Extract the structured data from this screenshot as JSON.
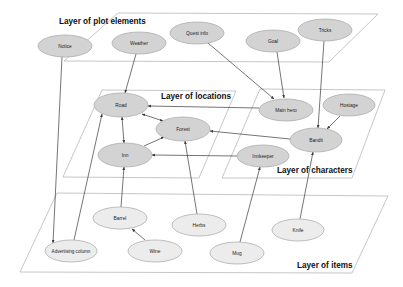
{
  "colors": {
    "node_dark": "#d3d3d3",
    "node_light": "#ececec",
    "node_stroke": "#a6a6a6",
    "plane_stroke": "#b8b8b8",
    "edge": "#3a3a3a"
  },
  "layers": [
    {
      "id": "plot",
      "label": "Layer of plot elements",
      "points": "64,61 118,13 378,14 329,62",
      "label_x": 59,
      "label_y": 24
    },
    {
      "id": "locations",
      "label": "Layer of locations",
      "points": "63,177 102,90 236,91 199,178",
      "label_x": 161,
      "label_y": 99
    },
    {
      "id": "characters",
      "label": "Layer of characters",
      "points": "222,178 260,89 385,90 352,178",
      "label_x": 277,
      "label_y": 173
    },
    {
      "id": "items",
      "label": "Layer of items",
      "points": "20,272 57,193 388,196 352,273",
      "label_x": 297,
      "label_y": 268
    }
  ],
  "nodes": [
    {
      "id": "notice",
      "label": "Notice",
      "x": 65,
      "y": 46,
      "rx": 27,
      "ry": 11,
      "tone": "dark"
    },
    {
      "id": "weather",
      "label": "Weather",
      "x": 139,
      "y": 43,
      "rx": 27,
      "ry": 11,
      "tone": "dark"
    },
    {
      "id": "quest",
      "label": "Quest info",
      "x": 197,
      "y": 33,
      "rx": 27,
      "ry": 11,
      "tone": "dark"
    },
    {
      "id": "goal",
      "label": "Goal",
      "x": 273,
      "y": 41,
      "rx": 27,
      "ry": 11,
      "tone": "dark"
    },
    {
      "id": "tricks",
      "label": "Tricks",
      "x": 325,
      "y": 30,
      "rx": 27,
      "ry": 11,
      "tone": "dark"
    },
    {
      "id": "road",
      "label": "Road",
      "x": 121,
      "y": 105,
      "rx": 27,
      "ry": 12,
      "tone": "dark"
    },
    {
      "id": "forest",
      "label": "Forest",
      "x": 183,
      "y": 129,
      "rx": 27,
      "ry": 12,
      "tone": "dark"
    },
    {
      "id": "inn",
      "label": "Inn",
      "x": 125,
      "y": 155,
      "rx": 27,
      "ry": 12,
      "tone": "dark"
    },
    {
      "id": "mainhero",
      "label": "Main hero",
      "x": 286,
      "y": 110,
      "rx": 27,
      "ry": 11,
      "tone": "dark"
    },
    {
      "id": "hostage",
      "label": "Hostage",
      "x": 349,
      "y": 105,
      "rx": 26,
      "ry": 11,
      "tone": "dark"
    },
    {
      "id": "bandit",
      "label": "Bandit",
      "x": 316,
      "y": 140,
      "rx": 26,
      "ry": 12,
      "tone": "dark"
    },
    {
      "id": "innkeeper",
      "label": "Innkeeper",
      "x": 263,
      "y": 156,
      "rx": 26,
      "ry": 11,
      "tone": "dark"
    },
    {
      "id": "barrel",
      "label": "Barrel",
      "x": 120,
      "y": 218,
      "rx": 27,
      "ry": 11,
      "tone": "light"
    },
    {
      "id": "herbs",
      "label": "Herbs",
      "x": 199,
      "y": 225,
      "rx": 27,
      "ry": 11,
      "tone": "light"
    },
    {
      "id": "knife",
      "label": "Knife",
      "x": 298,
      "y": 230,
      "rx": 26,
      "ry": 11,
      "tone": "light"
    },
    {
      "id": "advcol",
      "label": "Advertising column",
      "x": 71,
      "y": 251,
      "rx": 26,
      "ry": 11,
      "tone": "light"
    },
    {
      "id": "wine",
      "label": "Wine",
      "x": 155,
      "y": 251,
      "rx": 27,
      "ry": 11,
      "tone": "light"
    },
    {
      "id": "mug",
      "label": "Mug",
      "x": 237,
      "y": 253,
      "rx": 27,
      "ry": 11,
      "tone": "light"
    }
  ],
  "edges": [
    {
      "from": "notice",
      "to": "advcol",
      "x1": 62,
      "y1": 57,
      "x2": 53,
      "y2": 243,
      "start": false,
      "end": true
    },
    {
      "from": "weather",
      "to": "road",
      "x1": 136,
      "y1": 54,
      "x2": 125,
      "y2": 93,
      "start": false,
      "end": true
    },
    {
      "from": "quest",
      "to": "mainhero",
      "x1": 208,
      "y1": 43,
      "x2": 274,
      "y2": 99,
      "start": false,
      "end": true
    },
    {
      "from": "goal",
      "to": "mainhero",
      "x1": 277,
      "y1": 52,
      "x2": 284,
      "y2": 98,
      "start": false,
      "end": true
    },
    {
      "from": "tricks",
      "to": "bandit",
      "x1": 324,
      "y1": 41,
      "x2": 318,
      "y2": 128,
      "start": false,
      "end": true
    },
    {
      "from": "mainhero",
      "to": "road",
      "x1": 259,
      "y1": 108,
      "x2": 148,
      "y2": 106,
      "start": false,
      "end": true
    },
    {
      "from": "hostage",
      "to": "bandit",
      "x1": 340,
      "y1": 116,
      "x2": 327,
      "y2": 129,
      "start": false,
      "end": true
    },
    {
      "from": "bandit",
      "to": "forest",
      "x1": 290,
      "y1": 139,
      "x2": 210,
      "y2": 131,
      "start": false,
      "end": true
    },
    {
      "from": "innkeeper",
      "to": "inn",
      "x1": 237,
      "y1": 156,
      "x2": 152,
      "y2": 155,
      "start": false,
      "end": true
    },
    {
      "from": "road",
      "to": "forest",
      "x1": 142,
      "y1": 114,
      "x2": 163,
      "y2": 121,
      "start": true,
      "end": true
    },
    {
      "from": "road",
      "to": "inn",
      "x1": 122,
      "y1": 117,
      "x2": 124,
      "y2": 143,
      "start": true,
      "end": true
    },
    {
      "from": "inn",
      "to": "forest",
      "x1": 144,
      "y1": 146,
      "x2": 164,
      "y2": 137,
      "start": false,
      "end": true
    },
    {
      "from": "advcol",
      "to": "road",
      "x1": 74,
      "y1": 240,
      "x2": 102,
      "y2": 114,
      "start": false,
      "end": true
    },
    {
      "from": "barrel",
      "to": "inn",
      "x1": 121,
      "y1": 207,
      "x2": 124,
      "y2": 167,
      "start": false,
      "end": true
    },
    {
      "from": "herbs",
      "to": "forest",
      "x1": 197,
      "y1": 214,
      "x2": 185,
      "y2": 141,
      "start": false,
      "end": true
    },
    {
      "from": "mug",
      "to": "innkeeper",
      "x1": 240,
      "y1": 242,
      "x2": 260,
      "y2": 167,
      "start": false,
      "end": true
    },
    {
      "from": "knife",
      "to": "bandit",
      "x1": 300,
      "y1": 219,
      "x2": 313,
      "y2": 152,
      "start": false,
      "end": true
    },
    {
      "from": "wine",
      "to": "barrel",
      "x1": 145,
      "y1": 240,
      "x2": 132,
      "y2": 229,
      "start": false,
      "end": true
    }
  ]
}
